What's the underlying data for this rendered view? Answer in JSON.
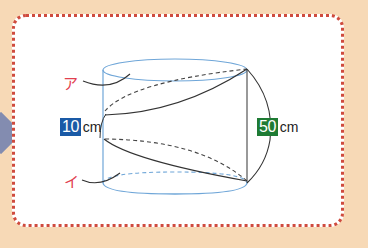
{
  "colors": {
    "background": "#f7d9b6",
    "frame_border": "#cf4b3e",
    "cylinder_outline": "#6fa6d8",
    "curve_line": "#333333",
    "label_red": "#e2404f",
    "box_blue": "#1a5aa6",
    "box_green": "#1e7b34"
  },
  "labels": {
    "point_a": "ア",
    "point_i": "イ"
  },
  "measures": {
    "height": {
      "value": "10",
      "unit": "cm"
    },
    "length": {
      "value": "50",
      "unit": "cm"
    }
  }
}
